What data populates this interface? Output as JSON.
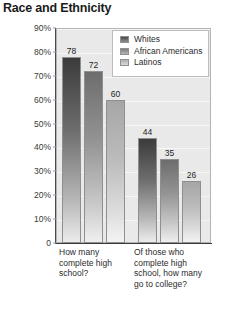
{
  "page": {
    "title": "Race and Ethnicity"
  },
  "chart_data": {
    "type": "bar",
    "title": "Race and Ethnicity",
    "xlabel": "",
    "ylabel": "",
    "ylim": [
      0,
      90
    ],
    "grid": true,
    "legend_position": "top-right",
    "categories": [
      "How many complete high school?",
      "Of those who complete high school, how many go to college?"
    ],
    "series": [
      {
        "name": "Whites",
        "values": [
          78,
          72
        ]
      },
      {
        "name": "African Americans",
        "values": [
          72,
          35
        ]
      },
      {
        "name": "Latinos",
        "values": [
          60,
          26
        ]
      }
    ],
    "bars": [
      {
        "group": 0,
        "series": 0,
        "label": "78",
        "value": 78
      },
      {
        "group": 0,
        "series": 1,
        "label": "72",
        "value": 72
      },
      {
        "group": 0,
        "series": 2,
        "label": "60",
        "value": 60
      },
      {
        "group": 1,
        "series": 0,
        "label": "44",
        "value": 44
      },
      {
        "group": 1,
        "series": 1,
        "label": "35",
        "value": 35
      },
      {
        "group": 1,
        "series": 2,
        "label": "26",
        "value": 26
      }
    ],
    "yticks": [
      {
        "value": 90,
        "label": "90%"
      },
      {
        "value": 80,
        "label": "80%"
      },
      {
        "value": 70,
        "label": "70%"
      },
      {
        "value": 60,
        "label": "60%"
      },
      {
        "value": 50,
        "label": "50%"
      },
      {
        "value": 40,
        "label": "40%"
      },
      {
        "value": 30,
        "label": "30%"
      },
      {
        "value": 20,
        "label": "20%"
      },
      {
        "value": 10,
        "label": "10%"
      },
      {
        "value": 0,
        "label": "0"
      }
    ],
    "legend": [
      {
        "label": "Whites",
        "color": "#4a4a4a"
      },
      {
        "label": "African Americans",
        "color": "#7d7d7d"
      },
      {
        "label": "Latinos",
        "color": "#b0b0b0"
      }
    ],
    "colors": {
      "series_0": "#4a4a4a",
      "series_1": "#7d7d7d",
      "series_2": "#b0b0b0",
      "plot_background": "#e9e9e9",
      "axis": "#3a3a3a",
      "title": "#1b1b1b"
    }
  }
}
